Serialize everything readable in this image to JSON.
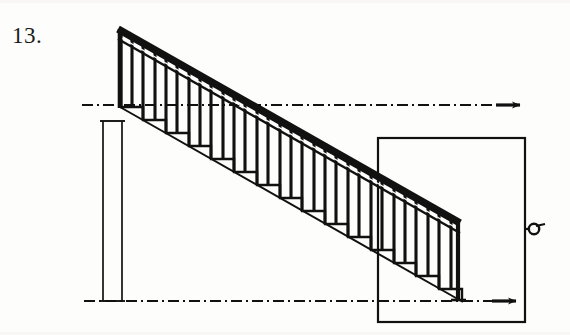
{
  "figure": {
    "label": "13.",
    "type": "line-drawing",
    "background_color": "#fdfdfb",
    "ink_color": "#111111"
  },
  "canvas": {
    "width": 570,
    "height": 335
  },
  "drawing": {
    "description": "Side elevation of a straight-run staircase with handrail, balusters and treads descending left to right, between an upper and lower datum line, with a vertical height dimension at left and a rectangular detail frame at right.",
    "handrail": {
      "name": "handrail",
      "start_x": 118,
      "start_y": 30,
      "end_x": 460,
      "end_y": 224,
      "thickness": 7
    },
    "stringer": {
      "name": "stringer",
      "start_x": 120,
      "start_y": 107,
      "end_x": 462,
      "end_y": 301,
      "thickness": 2
    },
    "balusters": {
      "name": "balusters",
      "count": 30,
      "thickness": 3,
      "spacing": 11.4
    },
    "steps": {
      "name": "stair-steps",
      "count": 15,
      "tread_run": 22.8,
      "riser_rise": 13.0,
      "first_tread_x": 120,
      "first_tread_y": 107
    },
    "newel_post": {
      "name": "newel-post",
      "x": 458,
      "top_y": 222,
      "bottom_y": 301
    }
  },
  "datum_lines": [
    {
      "name": "upper-datum-line",
      "style": "dash-dot",
      "y": 105,
      "x_start": 82,
      "x_end": 520,
      "terminator": "arrow",
      "arrow_x": 512
    },
    {
      "name": "lower-datum-line",
      "style": "dash-dot",
      "y": 301,
      "x_start": 84,
      "x_end": 516,
      "terminator": "arrow",
      "arrow_x": 508
    }
  ],
  "dimension": {
    "name": "height-dimension",
    "orientation": "vertical",
    "x_left": 103,
    "x_right": 122,
    "top_y": 121,
    "bottom_y": 301,
    "cap_style": "flat-tick"
  },
  "detail_frame": {
    "name": "detail-frame",
    "x": 378,
    "y": 138,
    "width": 147,
    "height": 184,
    "stroke": 2
  },
  "section_marker": {
    "name": "section-marker",
    "shape": "circle-with-tail",
    "center_x": 533,
    "center_y": 229,
    "radius": 5,
    "leader_x_start": 525,
    "leader_x_end": 529
  }
}
